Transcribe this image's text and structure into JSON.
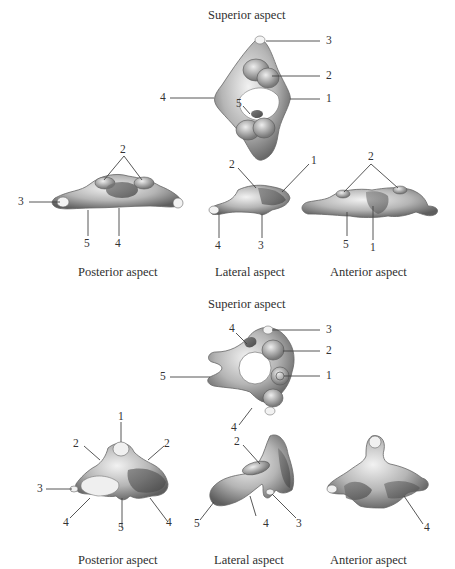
{
  "figure_top": {
    "superior": {
      "caption": "Superior aspect",
      "labels": [
        "3",
        "2",
        "4",
        "1",
        "5"
      ]
    },
    "posterior": {
      "caption": "Posterior aspect",
      "labels": [
        "2",
        "3",
        "5",
        "4"
      ]
    },
    "lateral": {
      "caption": "Lateral aspect",
      "labels": [
        "2",
        "1",
        "4",
        "3"
      ]
    },
    "anterior": {
      "caption": "Anterior aspect",
      "labels": [
        "2",
        "5",
        "1"
      ]
    }
  },
  "figure_bottom": {
    "superior": {
      "caption": "Superior aspect",
      "labels": [
        "4",
        "3",
        "2",
        "5",
        "1",
        "4"
      ]
    },
    "posterior": {
      "caption": "Posterior aspect",
      "labels": [
        "1",
        "2",
        "2",
        "3",
        "4",
        "5",
        "4"
      ]
    },
    "lateral": {
      "caption": "Lateral aspect",
      "labels": [
        "2",
        "5",
        "4",
        "3"
      ]
    },
    "anterior": {
      "caption": "Anterior aspect",
      "labels": [
        "4"
      ]
    }
  },
  "colors": {
    "bone_light": "#e6e6e6",
    "bone_mid": "#9a9a9a",
    "bone_dark": "#555555",
    "line": "#444444"
  }
}
